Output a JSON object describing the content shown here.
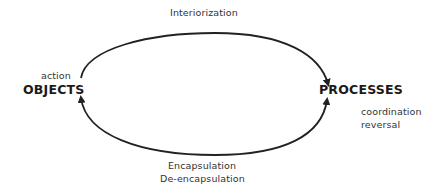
{
  "diagram": {
    "nodes": {
      "objects": {
        "label": "OBJECTS",
        "note": "action"
      },
      "processes": {
        "label": "PROCESSES",
        "notes": [
          "coordination",
          "reversal"
        ]
      }
    },
    "edges": {
      "top": {
        "label": "Interiorization",
        "from": "OBJECTS",
        "to": "PROCESSES"
      },
      "bottom": {
        "labels": [
          "Encapsulation",
          "De-encapsulation"
        ],
        "from": "PROCESSES",
        "to": "OBJECTS",
        "bidirectional": true
      }
    },
    "colors": {
      "stroke": "#222222",
      "text": "#222222",
      "background": "#ffffff"
    }
  }
}
